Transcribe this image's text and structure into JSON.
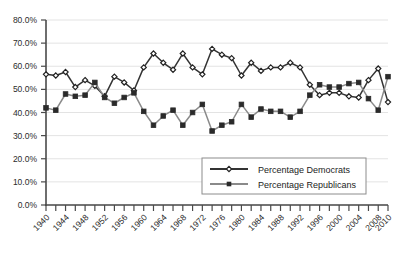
{
  "chart_data": {
    "type": "line",
    "title": "",
    "xlabel": "",
    "ylabel": "",
    "ylim": [
      0,
      80
    ],
    "xlim": [
      1940,
      2010
    ],
    "grid": true,
    "legend_position": "bottom-right",
    "y_tick_labels": [
      "80.0%",
      "70.0%",
      "60.0%",
      "50.0%",
      "40.0%",
      "30.0%",
      "20.0%",
      "10.0%",
      "0.0%"
    ],
    "y_tick_values": [
      80,
      70,
      60,
      50,
      40,
      30,
      20,
      10,
      0
    ],
    "x_tick_labels": [
      "1940",
      "1944",
      "1948",
      "1952",
      "1956",
      "1960",
      "1964",
      "1968",
      "1972",
      "1976",
      "1980",
      "1984",
      "1988",
      "1992",
      "1996",
      "2000",
      "2004",
      "2008",
      "2010"
    ],
    "x_tick_values": [
      1940,
      1944,
      1948,
      1952,
      1956,
      1960,
      1964,
      1968,
      1972,
      1976,
      1980,
      1984,
      1988,
      1992,
      1996,
      2000,
      2004,
      2008,
      2010
    ],
    "x_minor_step": 2,
    "x": [
      1940,
      1942,
      1944,
      1946,
      1948,
      1950,
      1952,
      1954,
      1956,
      1958,
      1960,
      1962,
      1964,
      1966,
      1968,
      1970,
      1972,
      1974,
      1976,
      1978,
      1980,
      1982,
      1984,
      1986,
      1988,
      1990,
      1992,
      1994,
      1996,
      1998,
      2000,
      2002,
      2004,
      2006,
      2008,
      2010
    ],
    "series": [
      {
        "name": "Percentage Democrats",
        "color": "#333333",
        "marker": "diamond-open",
        "values": [
          56.5,
          56.0,
          57.5,
          51.0,
          54.0,
          51.5,
          47.0,
          55.5,
          53.0,
          49.5,
          59.5,
          65.5,
          61.5,
          58.5,
          65.5,
          59.5,
          56.5,
          67.5,
          65.0,
          63.5,
          56.0,
          61.5,
          58.0,
          59.5,
          59.5,
          61.5,
          59.5,
          52.0,
          47.5,
          48.5,
          48.5,
          47.0,
          46.5,
          54.0,
          59.0,
          44.5
        ]
      },
      {
        "name": "Percentage Republicans",
        "color": "#8a8a8a",
        "marker": "square-filled",
        "values": [
          42.0,
          41.0,
          48.0,
          47.0,
          47.5,
          53.0,
          46.5,
          44.0,
          46.5,
          48.5,
          40.5,
          34.5,
          38.5,
          41.0,
          34.5,
          40.0,
          43.5,
          32.0,
          34.5,
          36.0,
          43.5,
          38.0,
          41.5,
          40.5,
          40.5,
          38.0,
          40.5,
          47.5,
          52.0,
          51.0,
          51.0,
          52.5,
          53.0,
          46.0,
          41.0,
          55.5
        ]
      }
    ]
  },
  "legend": {
    "entries": [
      {
        "label": "Percentage Democrats"
      },
      {
        "label": "Percentage Republicans"
      }
    ]
  }
}
